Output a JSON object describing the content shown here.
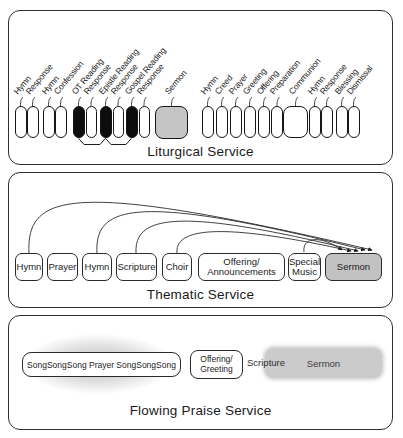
{
  "diagram": {
    "liturgical": {
      "title": "Liturgical Service",
      "items": [
        {
          "label": "Hymn",
          "fill": "white"
        },
        {
          "label": "Response",
          "fill": "white"
        },
        {
          "label": "Hymn",
          "fill": "white"
        },
        {
          "label": "Confession",
          "fill": "white"
        },
        {
          "label": "OT Reading",
          "fill": "black"
        },
        {
          "label": "Response",
          "fill": "white"
        },
        {
          "label": "Epistle Reading",
          "fill": "black"
        },
        {
          "label": "Response",
          "fill": "white"
        },
        {
          "label": "Gospel Reading",
          "fill": "black"
        },
        {
          "label": "Response",
          "fill": "white"
        },
        {
          "label": "Sermon",
          "fill": "gray"
        },
        {
          "label": "Hymn",
          "fill": "white"
        },
        {
          "label": "Creed",
          "fill": "white"
        },
        {
          "label": "Prayer",
          "fill": "white"
        },
        {
          "label": "Greeting",
          "fill": "white"
        },
        {
          "label": "Offering",
          "fill": "white"
        },
        {
          "label": "Preparation",
          "fill": "white"
        },
        {
          "label": "Communion",
          "fill": "white"
        },
        {
          "label": "Hymn",
          "fill": "white"
        },
        {
          "label": "Response",
          "fill": "white"
        },
        {
          "label": "Blessing",
          "fill": "white"
        },
        {
          "label": "Dismissal",
          "fill": "white"
        }
      ],
      "bracket_groups": [
        "OT Reading",
        "Epistle Reading",
        "Gospel Reading"
      ]
    },
    "thematic": {
      "title": "Thematic Service",
      "boxes": [
        {
          "label": "Hymn"
        },
        {
          "label": "Prayer"
        },
        {
          "label": "Hymn"
        },
        {
          "label": "Scripture"
        },
        {
          "label": "Choir"
        },
        {
          "lines": [
            "Offering/",
            "Announcements"
          ]
        },
        {
          "lines": [
            "Special",
            "Music"
          ]
        },
        {
          "label": "Sermon",
          "highlighted": true
        }
      ],
      "arrows_to_sermon_from": [
        "Hymn (1st)",
        "Hymn (3rd)",
        "Scripture",
        "Choir",
        "Special Music"
      ]
    },
    "flowing": {
      "title": "Flowing Praise Service",
      "song_box": "SongSongSong Prayer SongSongSong",
      "offering_box_lines": [
        "Offering/",
        "Greeting"
      ],
      "scripture_label": "Scripture",
      "sermon_label": "Sermon"
    }
  },
  "colors": {
    "highlight_gray": "#c5c5c5",
    "black_fill": "#0d0d0d",
    "border": "#2e2e2e"
  }
}
